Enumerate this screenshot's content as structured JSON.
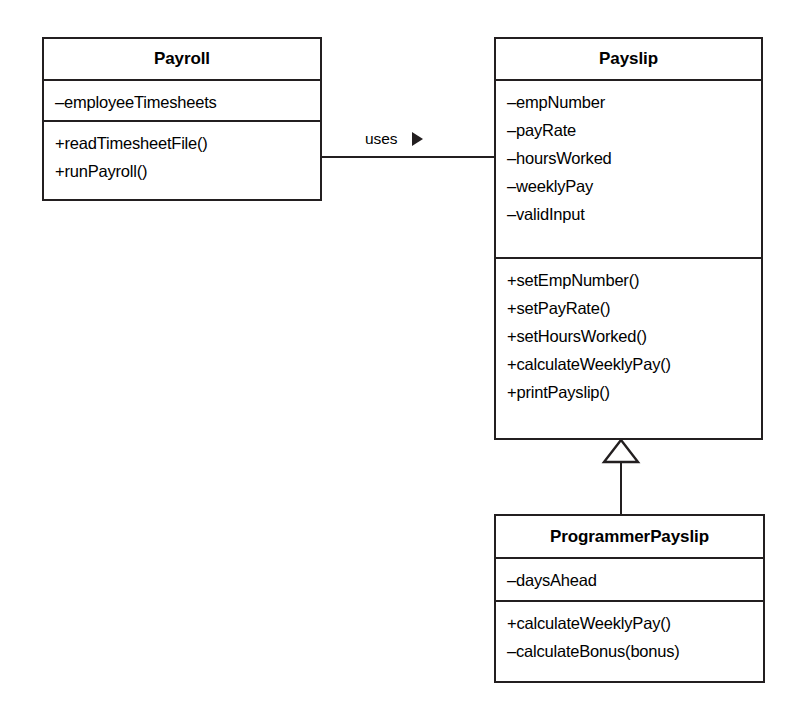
{
  "diagram": {
    "type": "uml-class-diagram",
    "background_color": "#ffffff",
    "line_color": "#231f20"
  },
  "classes": [
    {
      "id": "payroll",
      "name": "Payroll",
      "attributes": [
        "–employeeTimesheets"
      ],
      "methods": [
        "+readTimesheetFile()",
        "+runPayroll()"
      ]
    },
    {
      "id": "payslip",
      "name": "Payslip",
      "attributes": [
        "–empNumber",
        "–payRate",
        "–hoursWorked",
        "–weeklyPay",
        "–validInput"
      ],
      "methods": [
        "+setEmpNumber()",
        "+setPayRate()",
        "+setHoursWorked()",
        "+calculateWeeklyPay()",
        "+printPayslip()"
      ]
    },
    {
      "id": "programmerpayslip",
      "name": "ProgrammerPayslip",
      "attributes": [
        "–daysAhead"
      ],
      "methods": [
        "+calculateWeeklyPay()",
        "–calculateBonus(bonus)"
      ]
    }
  ],
  "relationships": [
    {
      "id": "uses",
      "kind": "association",
      "label": "uses",
      "direction_marker": "▶",
      "from": "Payroll",
      "to": "Payslip"
    },
    {
      "id": "inheritance",
      "kind": "generalization",
      "label": "",
      "from": "ProgrammerPayslip",
      "to": "Payslip"
    }
  ]
}
